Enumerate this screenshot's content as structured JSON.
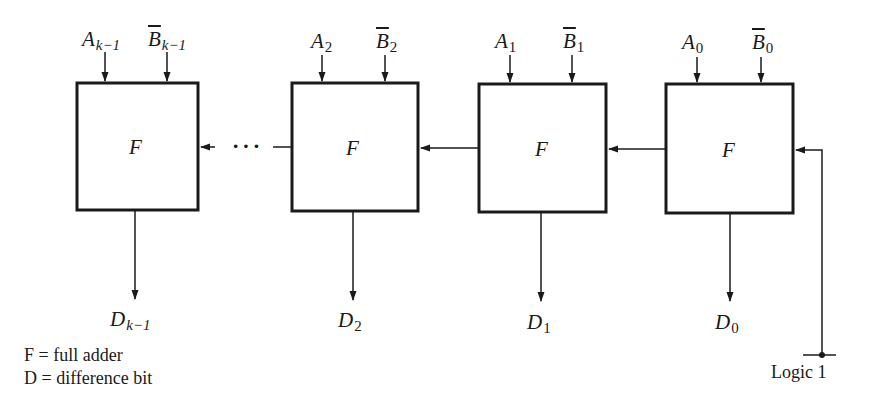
{
  "diagram": {
    "type": "ripple-borrow subtractor using full adders",
    "blocks": [
      {
        "id": "stage-k-1",
        "label": "F",
        "input_a": {
          "base": "A",
          "sub": "k−1"
        },
        "input_b": {
          "base": "B",
          "sub": "k−1"
        },
        "output": {
          "base": "D",
          "sub": "k−1"
        }
      },
      {
        "id": "stage-2",
        "label": "F",
        "input_a": {
          "base": "A",
          "sub": "2"
        },
        "input_b": {
          "base": "B",
          "sub": "2"
        },
        "output": {
          "base": "D",
          "sub": "2"
        }
      },
      {
        "id": "stage-1",
        "label": "F",
        "input_a": {
          "base": "A",
          "sub": "1"
        },
        "input_b": {
          "base": "B",
          "sub": "1"
        },
        "output": {
          "base": "D",
          "sub": "1"
        }
      },
      {
        "id": "stage-0",
        "label": "F",
        "input_a": {
          "base": "A",
          "sub": "0"
        },
        "input_b": {
          "base": "B",
          "sub": "0"
        },
        "output": {
          "base": "D",
          "sub": "0"
        }
      }
    ],
    "ellipsis": "···",
    "carry_in_label": "Logic 1",
    "legend": [
      "F = full adder",
      "D = difference bit"
    ],
    "colors": {
      "stroke": "#1a1a1a",
      "background": "#ffffff"
    }
  }
}
